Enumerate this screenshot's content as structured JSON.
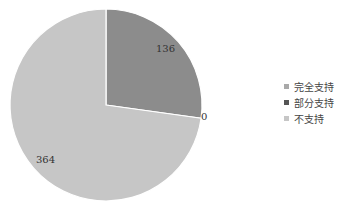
{
  "chart_data": {
    "type": "pie",
    "title": "",
    "categories": [
      "完全支持",
      "部分支持",
      "不支持"
    ],
    "values": [
      0,
      136,
      364
    ],
    "colors": [
      "#a9a9a9",
      "#8c8c8c",
      "#c6c6c6"
    ],
    "legend_colors": [
      "#a9a9a9",
      "#555555",
      "#c6c6c6"
    ],
    "data_labels": [
      "0",
      "136",
      "364"
    ],
    "start_angle_deg": 0,
    "direction": "clockwise",
    "legend_position": "right"
  },
  "legend": {
    "items": [
      {
        "label": "完全支持"
      },
      {
        "label": "部分支持"
      },
      {
        "label": "不支持"
      }
    ]
  },
  "labels": {
    "slice_0": "0",
    "slice_1": "136",
    "slice_2": "364"
  }
}
